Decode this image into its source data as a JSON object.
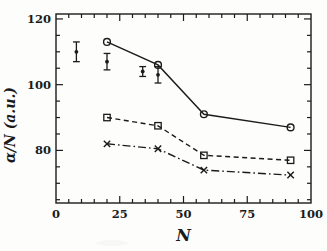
{
  "figure": {
    "background": "#fdfdfb",
    "ink": "#1b1b1b",
    "kind": "scanned scientific line plot"
  },
  "chart_data": {
    "type": "line",
    "title": "",
    "xlabel": "N",
    "ylabel": "α/N (a.u.)",
    "xlim": [
      0,
      100
    ],
    "ylim": [
      64,
      121.5
    ],
    "grid": false,
    "legend": "none",
    "frame": "box-with-inward-ticks",
    "x_minor_step": 5,
    "y_minor_step": 5,
    "x_major_ticks": [
      25,
      50,
      75
    ],
    "y_major_ticks": [
      80,
      100,
      120
    ],
    "x_tick_labels": [
      {
        "value": 0,
        "label": "0"
      },
      {
        "value": 25,
        "label": "25"
      },
      {
        "value": 50,
        "label": "50"
      },
      {
        "value": 75,
        "label": "75"
      },
      {
        "value": 100,
        "label": "100"
      }
    ],
    "y_tick_labels": [
      {
        "value": 80,
        "label": "80"
      },
      {
        "value": 100,
        "label": "100"
      },
      {
        "value": 120,
        "label": "120"
      }
    ],
    "series": [
      {
        "name": "solid-circles",
        "marker": "circle",
        "line": "solid",
        "x": [
          20,
          40,
          58,
          92
        ],
        "y": [
          113,
          106,
          91,
          87
        ]
      },
      {
        "name": "dashed-squares",
        "marker": "square",
        "line": "dashed",
        "x": [
          20,
          40,
          58,
          92
        ],
        "y": [
          90,
          87.5,
          78.5,
          77
        ]
      },
      {
        "name": "dashdot-crosses",
        "marker": "cross",
        "line": "dashdot",
        "x": [
          20,
          40,
          58,
          92
        ],
        "y": [
          82,
          80.5,
          74,
          72.5
        ]
      }
    ],
    "error_series": {
      "name": "experimental-points",
      "marker": "filled-circle-with-errorbar",
      "x": [
        8,
        20,
        34,
        40
      ],
      "y": [
        110,
        107,
        104,
        103
      ],
      "yerr": [
        3,
        2.5,
        1.5,
        2.5
      ]
    }
  }
}
